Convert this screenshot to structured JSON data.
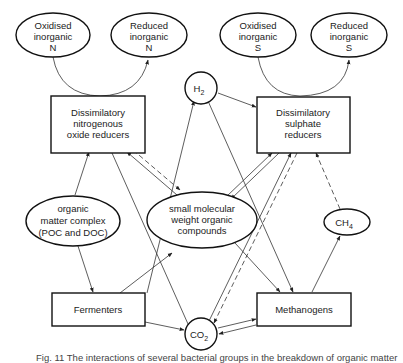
{
  "diagram": {
    "nodes": {
      "oxidised_n": {
        "lines": [
          "Oxidised",
          "inorganic",
          "N"
        ],
        "shape": "ellipse"
      },
      "reduced_n": {
        "lines": [
          "Reduced",
          "inorganic",
          "N"
        ],
        "shape": "ellipse"
      },
      "oxidised_s": {
        "lines": [
          "Oxidised",
          "inorganic",
          "S"
        ],
        "shape": "ellipse"
      },
      "reduced_s": {
        "lines": [
          "Reduced",
          "inorganic",
          "S"
        ],
        "shape": "ellipse"
      },
      "h2": {
        "label": "H",
        "subscript": "2",
        "shape": "circle"
      },
      "nitro_reducers": {
        "lines": [
          "Dissimilatory",
          "nitrogenous",
          "oxide reducers"
        ],
        "shape": "box"
      },
      "sulphate_reducers": {
        "lines": [
          "Dissimilatory",
          "sulphate",
          "reducers"
        ],
        "shape": "box"
      },
      "organic_matter": {
        "lines": [
          "organic",
          "matter complex",
          "(POC and DOC)"
        ],
        "shape": "ellipse"
      },
      "small_molecular": {
        "lines": [
          "small molecular",
          "weight organic",
          "compounds"
        ],
        "shape": "ellipse"
      },
      "ch4": {
        "label": "CH",
        "subscript": "4",
        "shape": "ellipse"
      },
      "fermenters": {
        "lines": [
          "Fermenters"
        ],
        "shape": "box"
      },
      "methanogens": {
        "lines": [
          "Methanogens"
        ],
        "shape": "box"
      },
      "co2": {
        "label": "CO",
        "subscript": "2",
        "shape": "circle"
      }
    },
    "edges": [
      {
        "from": "oxidised_n",
        "to": "reduced_n",
        "via": "nitro_reducers",
        "style": "solid"
      },
      {
        "from": "oxidised_s",
        "to": "reduced_s",
        "via": "sulphate_reducers",
        "style": "solid"
      },
      {
        "from": "h2",
        "to": "sulphate_reducers",
        "style": "solid"
      },
      {
        "from": "fermenters",
        "to": "h2",
        "style": "solid"
      },
      {
        "from": "h2",
        "to": "methanogens",
        "style": "solid"
      },
      {
        "from": "organic_matter",
        "to": "nitro_reducers",
        "style": "solid"
      },
      {
        "from": "organic_matter",
        "to": "fermenters",
        "style": "solid"
      },
      {
        "from": "nitro_reducers",
        "to": "small_molecular",
        "style": "solid"
      },
      {
        "from": "small_molecular",
        "to": "nitro_reducers",
        "style": "dashed"
      },
      {
        "from": "nitro_reducers",
        "to": "co2",
        "style": "solid"
      },
      {
        "from": "small_molecular",
        "to": "sulphate_reducers",
        "style": "solid"
      },
      {
        "from": "sulphate_reducers",
        "to": "small_molecular",
        "style": "solid"
      },
      {
        "from": "fermenters",
        "to": "small_molecular",
        "style": "solid"
      },
      {
        "from": "small_molecular",
        "to": "methanogens",
        "style": "solid"
      },
      {
        "from": "co2",
        "to": "sulphate_reducers",
        "style": "solid"
      },
      {
        "from": "sulphate_reducers",
        "to": "co2",
        "style": "dashed"
      },
      {
        "from": "sulphate_reducers",
        "to": "methanogens",
        "style": "solid"
      },
      {
        "from": "ch4",
        "to": "sulphate_reducers",
        "style": "dashed"
      },
      {
        "from": "methanogens",
        "to": "ch4",
        "style": "solid"
      },
      {
        "from": "fermenters",
        "to": "co2",
        "style": "solid"
      },
      {
        "from": "co2",
        "to": "methanogens",
        "style": "solid"
      },
      {
        "from": "methanogens",
        "to": "co2",
        "style": "solid"
      }
    ]
  },
  "caption": "Fig. 11  The interactions of several bacterial groups in the breakdown of organic matter"
}
